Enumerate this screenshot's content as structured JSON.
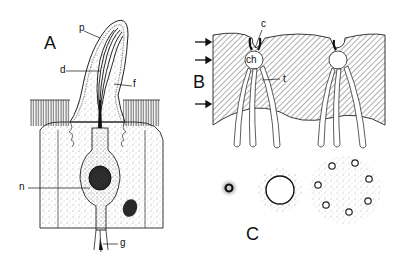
{
  "figure": {
    "panels": [
      {
        "id": "A",
        "label": "A",
        "description": "Longitudinal section of a sensory cone/papilla with sensory cell"
      },
      {
        "id": "B",
        "label": "B",
        "description": "Section through cuticle with canal pores, chambers and tubules"
      },
      {
        "id": "C",
        "label": "C",
        "description": "Transverse sections of pore/tubule arrangements"
      }
    ],
    "labels_A": {
      "p": "p",
      "d": "d",
      "f": "f",
      "n": "n",
      "g": "g"
    },
    "labels_B": {
      "c": "c",
      "ch": "ch",
      "t": "t"
    },
    "arrows_B": 3,
    "colors": {
      "ink": "#111111",
      "stipple": "#888888",
      "background": "#ffffff"
    }
  }
}
